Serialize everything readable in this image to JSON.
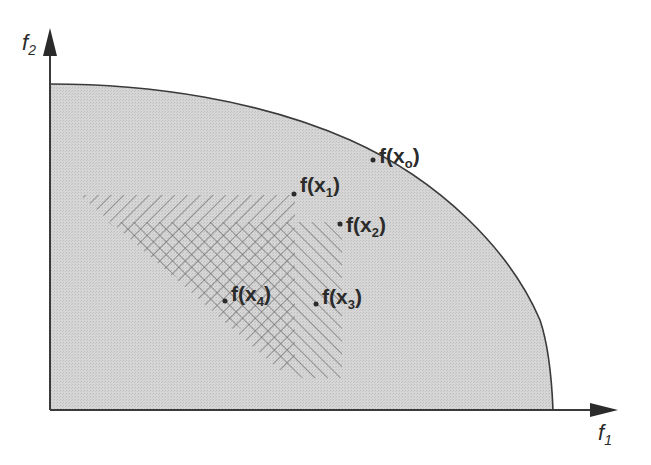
{
  "diagram": {
    "title": "",
    "axes": {
      "x_label": "f",
      "x_label_sub": "1",
      "y_label": "f",
      "y_label_sub": "2"
    },
    "colors": {
      "feasible_fill": "#d4d4d4",
      "boundary": "#3a3a3a",
      "hatch": "#6a6a6a",
      "text": "#2b2b2b",
      "background": "#ffffff"
    },
    "regions": [
      {
        "id": "feasible-region",
        "description": "Feasible objective space bounded by Pareto front curve"
      },
      {
        "id": "dominated-by-x1",
        "description": "Hatched region dominated by f(x1)"
      },
      {
        "id": "dominated-by-x2",
        "description": "Hatched region dominated by f(x2)"
      }
    ],
    "points": [
      {
        "name": "point-x0",
        "prefix": "f(x",
        "sub": "o",
        "suffix": ")",
        "note": "on Pareto front"
      },
      {
        "name": "point-x1",
        "prefix": "f(x",
        "sub": "1",
        "suffix": ")"
      },
      {
        "name": "point-x2",
        "prefix": "f(x",
        "sub": "2",
        "suffix": ")"
      },
      {
        "name": "point-x3",
        "prefix": "f(x",
        "sub": "3",
        "suffix": ")"
      },
      {
        "name": "point-x4",
        "prefix": "f(x",
        "sub": "4",
        "suffix": ")"
      }
    ]
  }
}
